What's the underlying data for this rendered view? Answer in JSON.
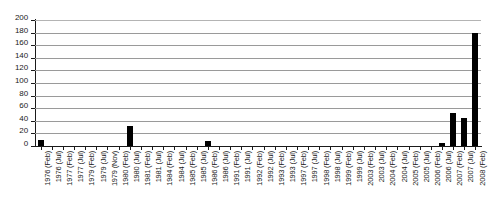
{
  "chart_data": {
    "type": "bar",
    "title": "",
    "xlabel": "",
    "ylabel": "",
    "ylim": [
      0,
      200
    ],
    "ytick_step": 20,
    "yticks": [
      200,
      180,
      160,
      140,
      120,
      100,
      80,
      60,
      40,
      20,
      0
    ],
    "grid": true,
    "legend": null,
    "bar_color": "#000000",
    "gridline_color": "#9a9a9a",
    "axis_color": "#1a1a1a",
    "categories": [
      "1976 (Feb)",
      "1976 (Jul)",
      "1977 (Feb)",
      "1977 (Jul)",
      "1979 (Feb)",
      "1979 (Jul)",
      "1979 (Nov)",
      "1980 (Feb)",
      "1980 (Jul)",
      "1981 (Feb)",
      "1981 (Jul)",
      "1984 (Feb)",
      "1984 (Jul)",
      "1985 (Feb)",
      "1985 (Jul)",
      "1986 (Feb)",
      "1986 (Jul)",
      "1991 (Feb)",
      "1991 (Jul)",
      "1992 (Feb)",
      "1992 (Jul)",
      "1993 (Feb)",
      "1993 (Jul)",
      "1997 (Feb)",
      "1997 (Jul)",
      "1998 (Feb)",
      "1998 (Jul)",
      "1999 (Feb)",
      "1999 (Jul)",
      "2003 (Feb)",
      "2003 (Jul)",
      "2004 (Feb)",
      "2004 (Jul)",
      "2005 (Feb)",
      "2005 (Jul)",
      "2006 (Feb)",
      "2006 (Jul)",
      "2007 (Feb)",
      "2007 (Jul)",
      "2008 (Feb)"
    ],
    "values": [
      9,
      0,
      0,
      0,
      0,
      0,
      0,
      0,
      32,
      0,
      0,
      0,
      0,
      0,
      0,
      8,
      0,
      0,
      0,
      0,
      0,
      0,
      0,
      0,
      0,
      0,
      0,
      0,
      0,
      0,
      0,
      0,
      0,
      0,
      0,
      0,
      5,
      52,
      45,
      179
    ]
  }
}
